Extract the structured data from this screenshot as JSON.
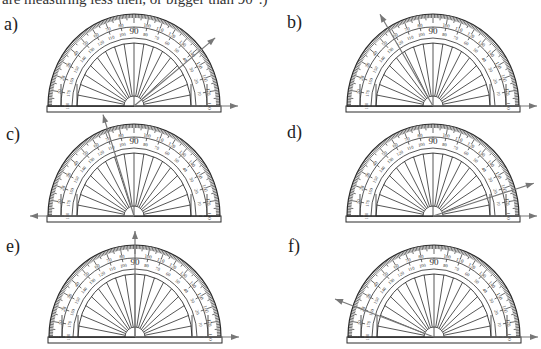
{
  "intro_text": "are measuring less then, or bigger than 90°.)",
  "colors": {
    "ink": "#2b2b2b",
    "arrow": "#777777",
    "background": "#ffffff"
  },
  "protractors": [
    {
      "label": "a)",
      "label_pos": [
        4,
        14
      ],
      "cx": 134,
      "base_y": 106,
      "arrow_angles": [
        0,
        40
      ]
    },
    {
      "label": "b)",
      "label_pos": [
        287,
        12
      ],
      "cx": 433,
      "base_y": 106,
      "arrow_angles": [
        0,
        120
      ]
    },
    {
      "label": "c)",
      "label_pos": [
        6,
        124
      ],
      "cx": 134,
      "base_y": 216,
      "arrow_angles": [
        180,
        107
      ]
    },
    {
      "label": "d)",
      "label_pos": [
        287,
        122
      ],
      "cx": 433,
      "base_y": 216,
      "arrow_angles": [
        0,
        18
      ]
    },
    {
      "label": "e)",
      "label_pos": [
        6,
        236
      ],
      "cx": 135,
      "base_y": 337,
      "arrow_angles": [
        0,
        90
      ]
    },
    {
      "label": "f)",
      "label_pos": [
        288,
        236
      ],
      "cx": 434,
      "base_y": 337,
      "arrow_angles": [
        0,
        159
      ]
    }
  ],
  "scale": {
    "outer_labels": [
      "0",
      "10",
      "20",
      "30",
      "40",
      "50",
      "60",
      "70",
      "80",
      "90",
      "100",
      "110",
      "120",
      "130",
      "140",
      "150",
      "160",
      "170",
      "180"
    ],
    "inner_labels": [
      "180",
      "170",
      "160",
      "150",
      "140",
      "130",
      "120",
      "110",
      "100",
      "90",
      "80",
      "70",
      "60",
      "50",
      "40",
      "30",
      "20",
      "10",
      "0"
    ],
    "center_label": "90"
  }
}
